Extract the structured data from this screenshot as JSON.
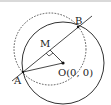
{
  "diagram": {
    "type": "geometry",
    "points": {
      "A": {
        "label": "A",
        "x": 23,
        "y": 72
      },
      "B": {
        "label": "B",
        "x": 78,
        "y": 27
      },
      "M": {
        "label": "M",
        "x": 50,
        "y": 50
      },
      "O": {
        "label": "O(0, 0)",
        "x": 63,
        "y": 63
      }
    },
    "circles": [
      {
        "name": "solid-circle-O",
        "cx": 63,
        "cy": 63,
        "r": 41,
        "style": "solid"
      },
      {
        "name": "dashed-circle-M",
        "cx": 50,
        "cy": 50,
        "r": 36,
        "style": "dashed"
      }
    ],
    "segments": [
      "AB line",
      "OM",
      "OA"
    ],
    "right_angle_at": "M",
    "colors": {
      "stroke": "#333333",
      "background": "#ffffff"
    }
  }
}
